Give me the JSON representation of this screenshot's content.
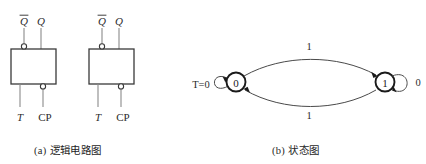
{
  "figure": {
    "panels": [
      {
        "id": "a",
        "caption_index": "(a)",
        "caption_text": "逻辑电路图",
        "circuits": [
          {
            "id": "ff-left",
            "outputs": [
              {
                "name": "q-bar-output",
                "label": "Q",
                "overbar": true,
                "inverted": true
              },
              {
                "name": "q-output",
                "label": "Q",
                "overbar": false,
                "inverted": false
              }
            ],
            "inputs": [
              {
                "name": "t-input",
                "label": "T",
                "italic": true,
                "inverted": false
              },
              {
                "name": "cp-input",
                "label": "CP",
                "italic": false,
                "inverted": true
              }
            ]
          },
          {
            "id": "ff-right",
            "outputs": [
              {
                "name": "q-bar-output",
                "label": "Q",
                "overbar": true,
                "inverted": true
              },
              {
                "name": "q-output",
                "label": "Q",
                "overbar": false,
                "inverted": false
              }
            ],
            "inputs": [
              {
                "name": "t-input",
                "label": "T",
                "italic": true,
                "inverted": false
              },
              {
                "name": "cp-input",
                "label": "CP",
                "italic": false,
                "inverted": true
              }
            ]
          }
        ]
      },
      {
        "id": "b",
        "caption_index": "(b)",
        "caption_text": "状态图",
        "state_diagram": {
          "states": [
            {
              "id": "s0",
              "label": "0"
            },
            {
              "id": "s1",
              "label": "1"
            }
          ],
          "self_loops": [
            {
              "state": "s0",
              "label": "T=0",
              "label_italic_prefix": "T",
              "label_rest": "=0",
              "side": "left"
            },
            {
              "state": "s1",
              "label": "0",
              "side": "right"
            }
          ],
          "transitions": [
            {
              "from": "s0",
              "to": "s1",
              "label": "1",
              "position": "top"
            },
            {
              "from": "s1",
              "to": "s0",
              "label": "1",
              "position": "bottom"
            }
          ]
        }
      }
    ]
  },
  "colors": {
    "background": "#ffffff",
    "wire": "#8a8a8a",
    "box_outline": "#3a3a3a",
    "state_outline": "#1a1a1a",
    "arc": "#4a4a4a",
    "text": "#1f1f1f"
  }
}
